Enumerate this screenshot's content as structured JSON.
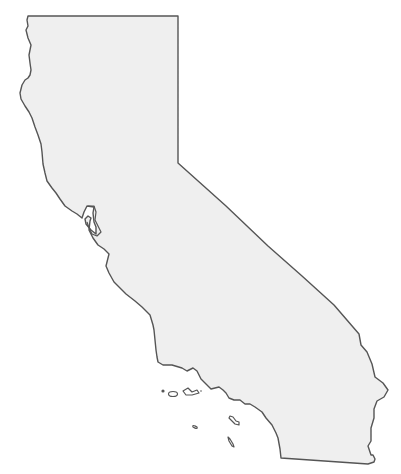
{
  "map": {
    "subject": "California state outline",
    "colors": {
      "background": "#ffffff",
      "land_fill": "#efefef",
      "outline": "#555555"
    },
    "features": [
      {
        "name": "mainland",
        "type": "state-outline"
      },
      {
        "name": "san-francisco-bay",
        "type": "bay"
      },
      {
        "name": "channel-islands",
        "type": "island-group",
        "count": 7
      }
    ]
  }
}
